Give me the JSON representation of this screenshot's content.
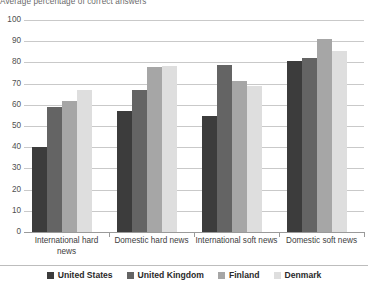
{
  "chart_data": {
    "type": "bar",
    "title": "Average percentage of correct answers",
    "xlabel": "",
    "ylabel": "",
    "ylim": [
      0,
      100
    ],
    "ytick_step": 10,
    "yticks": [
      100,
      90,
      80,
      70,
      60,
      50,
      40,
      30,
      20,
      10,
      0
    ],
    "grid": true,
    "legend_position": "bottom-center",
    "categories": [
      "International hard news",
      "Domestic hard news",
      "International soft news",
      "Domestic soft news"
    ],
    "series": [
      {
        "name": "United States",
        "color": "#3c3c3c",
        "values": [
          40,
          57,
          54.5,
          80.5
        ]
      },
      {
        "name": "United Kingdom",
        "color": "#646464",
        "values": [
          59,
          67,
          79,
          82
        ]
      },
      {
        "name": "Finland",
        "color": "#a6a6a6",
        "values": [
          62,
          78,
          71,
          91
        ]
      },
      {
        "name": "Denmark",
        "color": "#dedede",
        "values": [
          67,
          78.5,
          69,
          85.5
        ]
      }
    ]
  },
  "colors": {
    "gridline": "#c9c9c9",
    "axis": "#9a9a9a",
    "title_text": "#6a6a6a",
    "tick_text": "#4f4f4f",
    "category_text": "#3d3d3d",
    "legend_text": "#2a2a2a",
    "background": "#ffffff"
  }
}
